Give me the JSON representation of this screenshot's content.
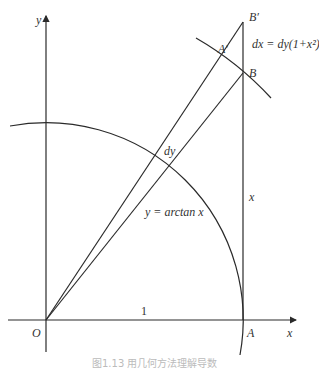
{
  "diagram": {
    "axes": {
      "x_label": "x",
      "y_label": "y",
      "origin_label": "O"
    },
    "points": {
      "A": "A",
      "B": "B",
      "A_prime": "A′",
      "B_prime": "B′"
    },
    "labels": {
      "unit": "1",
      "dy": "dy",
      "x_segment": "x",
      "curve": "y = arctan x",
      "dx_relation": "dx = dy(1+x²)"
    },
    "caption": "图1.13  用几何方法理解导数"
  }
}
